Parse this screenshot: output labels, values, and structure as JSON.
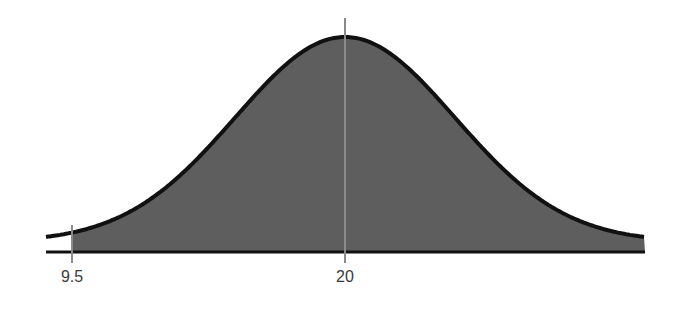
{
  "chart_data": {
    "type": "area",
    "title": "",
    "xlabel": "",
    "ylabel": "",
    "distribution": "normal",
    "mean": 20,
    "shaded_region": {
      "from": 9.5,
      "to": "+inf"
    },
    "x_ticks": [
      9.5,
      20
    ],
    "x_tick_labels": [
      "9.5",
      "20"
    ],
    "reference_lines": [
      {
        "x": 9.5,
        "label": "9.5"
      },
      {
        "x": 20,
        "label": "20"
      }
    ],
    "grid": false,
    "legend": null
  },
  "labels": {
    "left_tick": "9.5",
    "mean_tick": "20"
  },
  "colors": {
    "fill": "#5e5e5e",
    "curve": "#111111",
    "axis": "#111111",
    "marker_line": "#8a8a8a"
  },
  "geometry": {
    "x_start_px": 46,
    "x_end_px": 645,
    "mean_px": 345,
    "left_marker_px": 72,
    "baseline_px": 252,
    "peak_px": 37,
    "sigma_px": 110
  }
}
